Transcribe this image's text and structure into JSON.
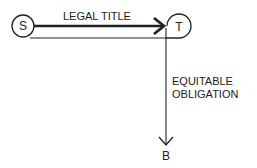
{
  "diagram": {
    "nodes": [
      {
        "id": "S",
        "label": "S"
      },
      {
        "id": "T",
        "label": "T"
      },
      {
        "id": "B",
        "label": "B"
      }
    ],
    "edges": [
      {
        "from": "S",
        "to": "T",
        "label": "LEGAL TITLE"
      },
      {
        "from": "T",
        "to": "B",
        "label_line1": "EQUITABLE",
        "label_line2": "OBLIGATION"
      }
    ]
  }
}
